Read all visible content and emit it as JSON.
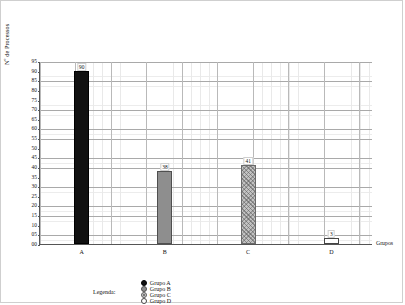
{
  "chart_data": {
    "type": "bar",
    "title": "",
    "xlabel": "Grupos",
    "ylabel": "Nº de Processos",
    "categories": [
      "A",
      "B",
      "C",
      "D"
    ],
    "values": [
      90,
      38,
      41,
      3
    ],
    "ylim": [
      0,
      95
    ],
    "ytick_step": 5,
    "ytick_labels": [
      "95",
      "90",
      "85",
      "80",
      "75",
      "70",
      "65",
      "60",
      "55",
      "50",
      "45",
      "40",
      "35",
      "30",
      "25",
      "20",
      "15",
      "10",
      "05",
      "00"
    ],
    "ytick_values": [
      95,
      90,
      85,
      80,
      75,
      70,
      65,
      60,
      55,
      50,
      45,
      40,
      35,
      30,
      25,
      20,
      15,
      10,
      5,
      0
    ],
    "grid": true,
    "legend_position": "bottom",
    "series": [
      {
        "name": "Grupo A",
        "category": "A",
        "value": 90,
        "color": "#111111",
        "fill": "solid-black"
      },
      {
        "name": "Grupo B",
        "category": "B",
        "value": 38,
        "color": "#8e8e8e",
        "fill": "solid-gray"
      },
      {
        "name": "Grupo C",
        "category": "C",
        "value": 41,
        "color": "#c2c2c2",
        "fill": "hatched-light-gray"
      },
      {
        "name": "Grupo D",
        "category": "D",
        "value": 3,
        "color": "#ffffff",
        "fill": "outline-white"
      }
    ],
    "bar_labels": [
      "90",
      "38",
      "41",
      "3"
    ]
  },
  "legend": {
    "title": "Legenda:",
    "items": [
      {
        "label": "Grupo A",
        "swatch": "filled-black-circle-icon"
      },
      {
        "label": "Grupo B",
        "swatch": "filled-gray-circle-icon"
      },
      {
        "label": "Grupo C",
        "swatch": "hatched-gray-circle-icon"
      },
      {
        "label": "Grupo D",
        "swatch": "outline-white-circle-icon"
      }
    ]
  }
}
